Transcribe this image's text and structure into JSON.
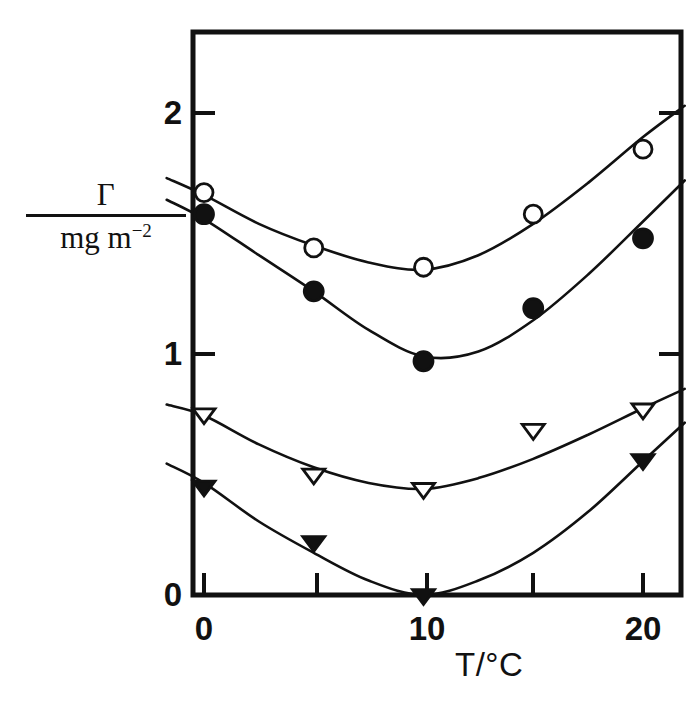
{
  "figure": {
    "background_color": "#ffffff",
    "ink_color": "#111111"
  },
  "axes": {
    "y_label_numerator": "Γ",
    "y_label_denominator": "mg m",
    "y_label_denominator_exponent": "−2",
    "x_axis_title": "T/°C",
    "y_tick_labels": [
      "0",
      "1",
      "2"
    ],
    "x_tick_labels": [
      "0",
      "10",
      "20"
    ]
  },
  "chart_data": {
    "type": "scatter",
    "title": "",
    "xlabel": "T/°C",
    "ylabel": "Γ / mg m⁻²",
    "xlim": [
      -1.7,
      21.9
    ],
    "ylim": [
      -0.215,
      2.33
    ],
    "x_ticks": [
      0,
      5,
      10,
      15,
      20
    ],
    "x_tick_labels_shown": [
      0,
      10,
      20
    ],
    "y_ticks": [
      0,
      1,
      2
    ],
    "grid": false,
    "legend": "none",
    "series": [
      {
        "name": "open-circle",
        "marker": "open-circle",
        "x": [
          0,
          5,
          10,
          15,
          20
        ],
        "values": [
          1.67,
          1.44,
          1.36,
          1.58,
          1.85
        ],
        "curve_x": [
          -1.7,
          0,
          2.5,
          5,
          7.5,
          10,
          12.5,
          15,
          17.5,
          20,
          21.9
        ],
        "curve_y": [
          1.73,
          1.66,
          1.54,
          1.45,
          1.38,
          1.35,
          1.41,
          1.54,
          1.71,
          1.9,
          2.03
        ]
      },
      {
        "name": "filled-circle",
        "marker": "filled-circle",
        "x": [
          0,
          5,
          10,
          15,
          20
        ],
        "values": [
          1.58,
          1.26,
          0.97,
          1.19,
          1.48
        ],
        "curve_x": [
          -1.7,
          0,
          2.5,
          5,
          7.5,
          10,
          12.5,
          15,
          17.5,
          20,
          21.9
        ],
        "curve_y": [
          1.64,
          1.56,
          1.41,
          1.26,
          1.1,
          0.99,
          1.01,
          1.14,
          1.33,
          1.55,
          1.72
        ]
      },
      {
        "name": "open-triangle",
        "marker": "open-triangle",
        "x": [
          0,
          5,
          10,
          15,
          20
        ],
        "values": [
          0.75,
          0.5,
          0.44,
          0.685,
          0.77
        ],
        "curve_x": [
          -1.7,
          0,
          2.5,
          5,
          7.5,
          10,
          12.5,
          15,
          17.5,
          20,
          21.9
        ],
        "curve_y": [
          0.79,
          0.745,
          0.625,
          0.53,
          0.465,
          0.44,
          0.485,
          0.565,
          0.665,
          0.775,
          0.855
        ]
      },
      {
        "name": "filled-triangle",
        "marker": "filled-triangle",
        "x": [
          0,
          5,
          10,
          15,
          20
        ],
        "values": [
          0.45,
          0.22,
          0.0,
          null,
          0.56
        ],
        "curve_x": [
          -1.7,
          0,
          2.5,
          5,
          7.5,
          10,
          12.5,
          15,
          17.5,
          20,
          21.9
        ],
        "curve_y": [
          0.545,
          0.465,
          0.305,
          0.175,
          0.06,
          0.0,
          0.06,
          0.175,
          0.345,
          0.555,
          0.715
        ]
      }
    ]
  }
}
